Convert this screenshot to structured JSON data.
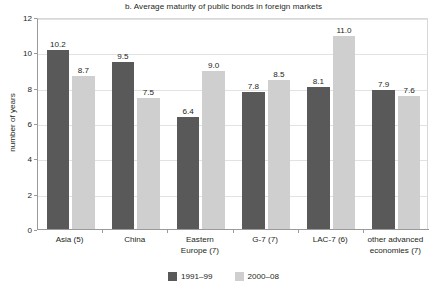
{
  "chart_data": {
    "type": "bar",
    "title": "b. Average maturity of public bonds in foreign markets",
    "xlabel": "",
    "ylabel": "number of years",
    "ylim": [
      0,
      12
    ],
    "yticks": [
      0,
      2,
      4,
      6,
      8,
      10,
      12
    ],
    "ytick_labels": [
      "0",
      "2",
      "4",
      "6",
      "8",
      "10",
      "12"
    ],
    "grid": true,
    "legend_position": "bottom-center",
    "categories": [
      "Asia (5)",
      "China",
      "Eastern Europe (7)",
      "G-7 (7)",
      "LAC-7 (6)",
      "other advanced economies (7)"
    ],
    "category_lines": [
      [
        "Asia (5)"
      ],
      [
        "China"
      ],
      [
        "Eastern",
        "Europe (7)"
      ],
      [
        "G-7 (7)"
      ],
      [
        "LAC-7 (6)"
      ],
      [
        "other advanced",
        "economies (7)"
      ]
    ],
    "series": [
      {
        "name": "1991–99",
        "color": "#595959",
        "values": [
          10.2,
          9.5,
          6.4,
          7.8,
          8.1,
          7.9
        ],
        "value_labels": [
          "10.2",
          "9.5",
          "6.4",
          "7.8",
          "8.1",
          "7.9"
        ]
      },
      {
        "name": "2000–08",
        "color": "#cfcfcf",
        "values": [
          8.7,
          7.5,
          9.0,
          8.5,
          11.0,
          7.6
        ],
        "value_labels": [
          "8.7",
          "7.5",
          "9.0",
          "8.5",
          "11.0",
          "7.6"
        ]
      }
    ]
  },
  "legend": {
    "items": [
      {
        "label": "1991–99",
        "color": "#595959"
      },
      {
        "label": "2000–08",
        "color": "#cfcfcf"
      }
    ]
  },
  "colors": {
    "series_1991_99": "#595959",
    "series_2000_08": "#cfcfcf",
    "axis": "#9a9a9a",
    "grid": "#e2e2e2",
    "text": "#231f20",
    "background": "#ffffff"
  }
}
